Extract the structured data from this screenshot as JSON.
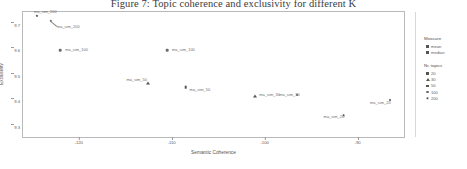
{
  "figure": {
    "title": "Figure 7: Topic coherence and exclusivity for different K"
  },
  "axes": {
    "xlabel": "Semantic Coherence",
    "ylabel": "Exclusivity",
    "xticks": [
      "-120",
      "-110",
      "-100",
      "-90"
    ],
    "yticks": [
      "9.7",
      "9.6",
      "9.5",
      "9.4",
      "9.3"
    ]
  },
  "legend": {
    "measure": {
      "title": "Measure",
      "items": [
        {
          "label": "mean",
          "marker": "square"
        },
        {
          "label": "median",
          "marker": "square"
        }
      ]
    },
    "topics": {
      "title": "Nr. topics",
      "items": [
        {
          "label": "20",
          "marker": "square"
        },
        {
          "label": "30",
          "marker": "triangle"
        },
        {
          "label": "50",
          "marker": "square"
        },
        {
          "label": "100",
          "marker": "circle"
        },
        {
          "label": "200",
          "marker": "star"
        }
      ]
    }
  },
  "chart_data": {
    "type": "scatter",
    "title": "Figure 7: Topic coherence and exclusivity for different K",
    "xlabel": "Semantic Coherence",
    "ylabel": "Exclusivity",
    "xlim": [
      -126,
      -85
    ],
    "ylim": [
      9.26,
      9.75
    ],
    "grid": false,
    "legend_position": "right",
    "points": [
      {
        "label": "ma_sim_200",
        "x": -124.5,
        "y": 9.735,
        "marker": "star",
        "topics": 200,
        "label_dx": -3,
        "label_dy": -5,
        "leader": false
      },
      {
        "label": "ma_sim_200",
        "x": -123.0,
        "y": 9.715,
        "marker": "star",
        "topics": 200,
        "label_dx": 6,
        "label_dy": 5,
        "leader": true
      },
      {
        "label": "ma_sim_100",
        "x": -122.0,
        "y": 9.6,
        "marker": "circle",
        "topics": 100,
        "label_dx": 5,
        "label_dy": -1,
        "leader": false
      },
      {
        "label": "ma_sim_100",
        "x": -110.5,
        "y": 9.6,
        "marker": "circle",
        "topics": 100,
        "label_dx": 5,
        "label_dy": -1,
        "leader": false
      },
      {
        "label": "ma_sim_50",
        "x": -112.5,
        "y": 9.47,
        "marker": "triangle",
        "topics": 50,
        "label_dx": -22,
        "label_dy": -4,
        "leader": false
      },
      {
        "label": "ma_sim_50",
        "x": -108.5,
        "y": 9.455,
        "marker": "square",
        "topics": 50,
        "label_dx": 4,
        "label_dy": 2,
        "leader": false
      },
      {
        "label": "ma_sim_30",
        "x": -101.0,
        "y": 9.42,
        "marker": "triangle",
        "topics": 30,
        "label_dx": 4,
        "label_dy": -2,
        "leader": false
      },
      {
        "label": "ma_sim_30",
        "x": -96.5,
        "y": 9.425,
        "marker": "star",
        "topics": 30,
        "label_dx": -18,
        "label_dy": -1,
        "leader": false
      },
      {
        "label": "ma_sim_20",
        "x": -91.5,
        "y": 9.345,
        "marker": "star",
        "topics": 20,
        "label_dx": -20,
        "label_dy": 1,
        "leader": false
      },
      {
        "label": "ma_sim_20",
        "x": -86.5,
        "y": 9.405,
        "marker": "star",
        "topics": 20,
        "label_dx": -20,
        "label_dy": 2,
        "leader": false
      }
    ]
  }
}
